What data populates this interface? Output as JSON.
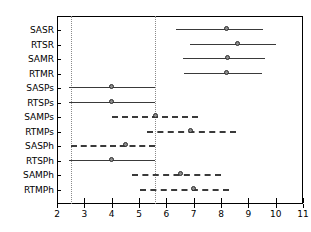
{
  "chart_data": {
    "type": "scatter",
    "subtype": "forest-plot",
    "title": "",
    "xlabel": "",
    "ylabel": "",
    "xlim": [
      2,
      11
    ],
    "xticks": [
      2,
      3,
      4,
      5,
      6,
      7,
      8,
      9,
      10,
      11
    ],
    "xticklabels": [
      "2",
      "3",
      "4",
      "5",
      "6",
      "7",
      "8",
      "9",
      "10",
      "11"
    ],
    "grid": false,
    "legend": null,
    "reference_lines": [
      {
        "name": "left-reference",
        "x": 2.5,
        "style": "dotted"
      },
      {
        "name": "right-reference",
        "x": 5.6,
        "style": "dotted"
      }
    ],
    "categories": [
      "SASR",
      "RTSR",
      "SAMR",
      "RTMR",
      "SASPs",
      "RTSPs",
      "SAMPs",
      "RTMPs",
      "SASPh",
      "RTSPh",
      "SAMPh",
      "RTMPh"
    ],
    "series": [
      {
        "name": "estimate with interval",
        "points": [
          {
            "category": "SASR",
            "estimate": 8.2,
            "lower": 6.35,
            "upper": 9.55,
            "line_style": "solid"
          },
          {
            "category": "RTSR",
            "estimate": 8.6,
            "lower": 6.85,
            "upper": 10.0,
            "line_style": "solid"
          },
          {
            "category": "SAMR",
            "estimate": 8.25,
            "lower": 6.6,
            "upper": 9.6,
            "line_style": "solid"
          },
          {
            "category": "RTMR",
            "estimate": 8.2,
            "lower": 6.65,
            "upper": 9.5,
            "line_style": "solid"
          },
          {
            "category": "SASPs",
            "estimate": 4.0,
            "lower": 2.45,
            "upper": 5.6,
            "line_style": "solid"
          },
          {
            "category": "RTSPs",
            "estimate": 4.0,
            "lower": 2.45,
            "upper": 5.6,
            "line_style": "solid"
          },
          {
            "category": "SAMPs",
            "estimate": 5.6,
            "lower": 4.0,
            "upper": 7.15,
            "line_style": "dashed"
          },
          {
            "category": "RTMPs",
            "estimate": 6.9,
            "lower": 5.3,
            "upper": 8.55,
            "line_style": "dashed"
          },
          {
            "category": "SASPh",
            "estimate": 4.5,
            "lower": 2.5,
            "upper": 5.6,
            "line_style": "dashed"
          },
          {
            "category": "RTSPh",
            "estimate": 4.0,
            "lower": 2.45,
            "upper": 5.6,
            "line_style": "solid"
          },
          {
            "category": "SAMPh",
            "estimate": 6.5,
            "lower": 4.75,
            "upper": 8.0,
            "line_style": "dashed"
          },
          {
            "category": "RTMPh",
            "estimate": 7.0,
            "lower": 5.05,
            "upper": 8.3,
            "line_style": "dashed"
          }
        ]
      }
    ],
    "colors": {
      "line": "#3a3a3a",
      "marker_fill": "#8c8c8c",
      "marker_edge": "#2b2b2b",
      "axis": "#000000",
      "reference": "#8a8a8a"
    }
  }
}
